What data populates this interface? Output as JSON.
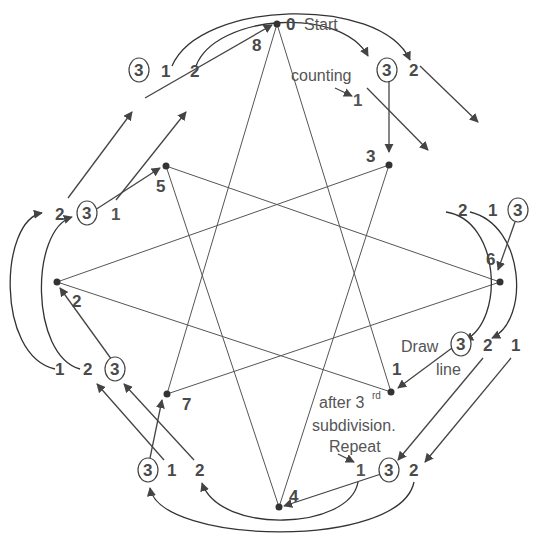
{
  "diagram": {
    "colors": {
      "stroke": "#555555",
      "text": "#4a4a4a",
      "dot": "#333333",
      "background": "#ffffff"
    },
    "vertices": [
      {
        "id": "0",
        "label": "0",
        "x": 277,
        "y": 24
      },
      {
        "id": "1",
        "label": "1",
        "x": 391,
        "y": 392
      },
      {
        "id": "2",
        "label": "2",
        "x": 57,
        "y": 282
      },
      {
        "id": "3",
        "label": "3",
        "x": 389,
        "y": 165
      },
      {
        "id": "4",
        "label": "4",
        "x": 279,
        "y": 507
      },
      {
        "id": "5",
        "label": "5",
        "x": 166,
        "y": 166
      },
      {
        "id": "6",
        "label": "6",
        "x": 500,
        "y": 282
      },
      {
        "id": "7",
        "label": "7",
        "x": 167,
        "y": 394
      },
      {
        "id": "8",
        "label": "8"
      }
    ],
    "star_edges": [
      [
        "0",
        "1"
      ],
      [
        "1",
        "2"
      ],
      [
        "2",
        "3"
      ],
      [
        "3",
        "4"
      ],
      [
        "4",
        "5"
      ],
      [
        "5",
        "6"
      ],
      [
        "6",
        "7"
      ],
      [
        "7",
        "0"
      ]
    ],
    "annotations": {
      "start_line1": "Start",
      "start_line2": "counting",
      "draw_line1": "Draw",
      "draw_line2": "line",
      "after_line1": "after 3",
      "after_sup": "rd",
      "after_line2": "subdivision.",
      "after_line3": "Repeat"
    },
    "count_labels": {
      "top": [
        "1",
        "3",
        "2"
      ],
      "top_left": [
        "3",
        "1",
        "2"
      ],
      "left": [
        "2",
        "3",
        "1"
      ],
      "lower_left": [
        "1",
        "2",
        "3"
      ],
      "bottom_left": [
        "3",
        "1",
        "2"
      ],
      "bottom_right": [
        "1",
        "3",
        "2"
      ],
      "right_lower": [
        "3",
        "2",
        "1"
      ],
      "right_upper": [
        "2",
        "1",
        "3"
      ],
      "circled_value": "3"
    }
  }
}
